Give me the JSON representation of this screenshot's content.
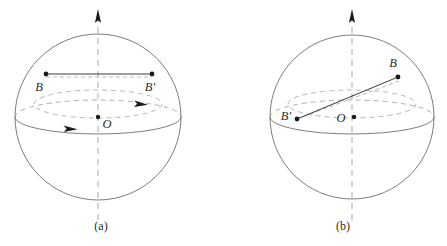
{
  "figure": {
    "background_color": "#ffffff",
    "stroke_color": "#6e6e6e",
    "dash_color": "#a5a5a5",
    "dot_color": "#1a1a1a"
  },
  "panels": [
    {
      "id": "a",
      "caption": "(a)",
      "caption_x": 101,
      "caption_y": 228,
      "sphere": {
        "cx": 98,
        "cy": 117,
        "r": 83
      },
      "axis": {
        "x": 98,
        "y_top": 10,
        "y_bottom": 222,
        "arrow_at_top": true
      },
      "center_point": {
        "label": "O",
        "x": 98,
        "y": 117,
        "label_x": 104,
        "label_y": 127
      },
      "points": [
        {
          "label": "B",
          "x": 46,
          "y": 74,
          "label_x": 39,
          "label_y": 91
        },
        {
          "label": "B'",
          "x": 152,
          "y": 74,
          "label_x": 150,
          "label_y": 91
        }
      ],
      "chord": {
        "x1": 46,
        "y1": 74,
        "x2": 152,
        "y2": 74,
        "style": "horizontal-solid"
      },
      "latitude_circle": {
        "cx": 98,
        "cy": 104,
        "rx": 64,
        "ry": 14,
        "dashed": true
      },
      "latitude_arrow": {
        "x": 142,
        "y": 104,
        "direction": "right"
      },
      "equator_arrow": {
        "x": 71,
        "y": 128,
        "direction": "right"
      },
      "equator": {
        "cx": 98,
        "cy": 117,
        "rx": 83,
        "ry": 17
      }
    },
    {
      "id": "b",
      "caption": "(b)",
      "caption_x": 343,
      "caption_y": 228,
      "sphere": {
        "cx": 352,
        "cy": 117,
        "r": 82
      },
      "axis": {
        "x": 352,
        "y_top": 10,
        "y_bottom": 222,
        "arrow_at_top": true
      },
      "center_point": {
        "label": "O",
        "x": 365,
        "y": 117,
        "label_x": 338,
        "label_y": 124
      },
      "points": [
        {
          "label": "B",
          "x": 398,
          "y": 77,
          "label_x": 392,
          "label_y": 67
        },
        {
          "label": "B'",
          "x": 297,
          "y": 119,
          "label_x": 280,
          "label_y": 120
        }
      ],
      "chord": {
        "x1": 297,
        "y1": 119,
        "x2": 398,
        "y2": 77,
        "style": "tilted-solid"
      },
      "chord_shadow": {
        "x1": 297,
        "y1": 119,
        "x2": 398,
        "y2": 82,
        "dashed": true
      },
      "latitude_circle": {
        "cx": 352,
        "cy": 104,
        "rx": 64,
        "ry": 14,
        "dashed": true
      },
      "equator": {
        "cx": 352,
        "cy": 117,
        "rx": 82,
        "ry": 17
      }
    }
  ]
}
